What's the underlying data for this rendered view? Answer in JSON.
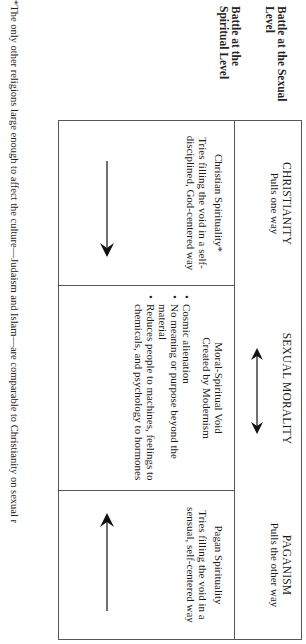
{
  "row_labels": {
    "sexual": "Battle at the Sexual Level",
    "spiritual": "Battle at the Spiritual Level"
  },
  "header": {
    "left": {
      "title": "CHRISTIANITY",
      "subtitle": "Pulls one way"
    },
    "center": {
      "title": "SEXUAL MORALITY",
      "arrow": "double-headed-arrow"
    },
    "right": {
      "title": "PAGANISM",
      "subtitle": "Pulls the other way"
    }
  },
  "body": {
    "left": {
      "title": "Christian Spirituality*",
      "description": "Tries filling the void in a self-disciplined, God-centered way",
      "arrow": "arrow-right"
    },
    "center": {
      "title": "Moral-Spiritual Void",
      "subtitle": "Created by Modernism",
      "bullets": [
        "Cosmic alienation",
        "No meaning or purpose beyond the material",
        "Reduces people to machines, feelings to chemicals, and psychology to hormones"
      ]
    },
    "right": {
      "title": "Pagan Spirituality",
      "description": "Tries filling the void in a sensual, self-centered way",
      "arrow": "arrow-left"
    }
  },
  "footnote": "*The only other religions large enough to affect the culture—Judaism and Islam—are comparable to Christianity on sexual r"
}
